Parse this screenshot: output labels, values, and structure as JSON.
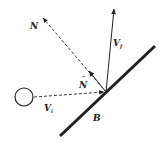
{
  "diagram": {
    "title": "",
    "colors": {
      "ink": "#222222",
      "background": "#ffffff"
    },
    "elements": {
      "ball": {
        "label": ""
      },
      "incident_velocity": {
        "label": "V",
        "subscript": "i",
        "style": "dashed"
      },
      "final_velocity": {
        "label": "V",
        "subscript": "f",
        "style": "solid"
      },
      "normal_line": {
        "label": "N",
        "style": "dashed"
      },
      "unit_normal": {
        "label": "N",
        "hat": "^",
        "style": "solid"
      },
      "bar": {
        "label": "B",
        "style": "thick solid"
      }
    }
  }
}
